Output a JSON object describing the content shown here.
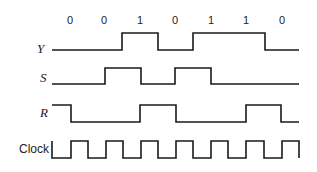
{
  "bit_labels": [
    "0",
    "0",
    "1",
    "0",
    "1",
    "1",
    "0"
  ],
  "signals": {
    "y": {
      "label": "Y",
      "levels": [
        0,
        0,
        1,
        0,
        1,
        1,
        0
      ]
    },
    "s": {
      "label": "S",
      "levels": [
        0,
        0,
        1,
        0,
        1,
        0,
        0
      ]
    },
    "r": {
      "label": "R",
      "levels": [
        1,
        0,
        0,
        1,
        0,
        0,
        1,
        0
      ]
    },
    "clock": {
      "label": "Clock",
      "cycles": 7
    }
  },
  "colors": {
    "line": "#1a1a1a",
    "background": "#ffffff"
  }
}
